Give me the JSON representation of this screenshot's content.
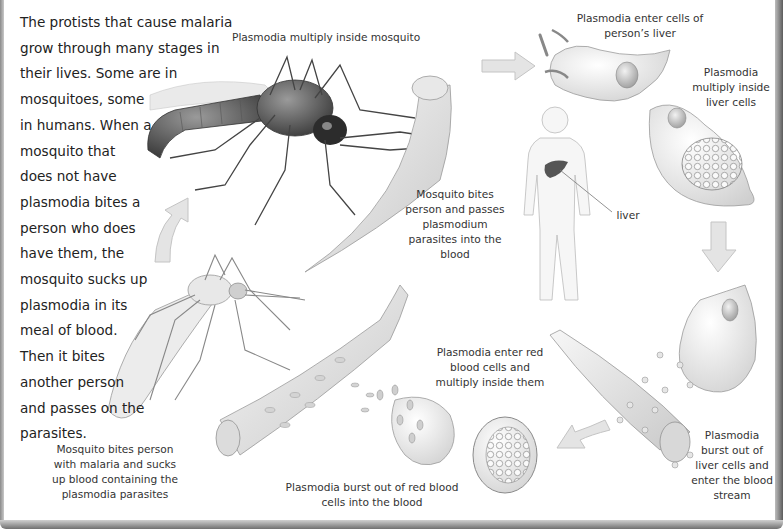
{
  "intro_text": {
    "lines": [
      "The protists that cause malaria",
      "grow through many stages in",
      "their lives. Some are in",
      "mosquitoes, some",
      "in humans. When a",
      "mosquito that",
      "does not have",
      "plasmodia bites a",
      "person who does",
      "have them, the",
      "mosquito sucks up",
      "plasmodia in its",
      "meal of blood.",
      "Then it bites",
      "another person",
      "and passes on the",
      "parasites."
    ]
  },
  "captions": {
    "multiply_mosquito": {
      "lines": [
        "Plasmodia multiply inside mosquito"
      ]
    },
    "enter_liver": {
      "lines": [
        "Plasmodia enter cells of",
        "person’s liver"
      ]
    },
    "multiply_liver": {
      "lines": [
        "Plasmodia",
        "multiply inside",
        "liver cells"
      ]
    },
    "bite_passes": {
      "lines": [
        "Mosquito bites",
        "person and passes",
        "plasmodium",
        "parasites into the",
        "blood"
      ]
    },
    "liver_label": {
      "lines": [
        "liver"
      ]
    },
    "enter_red_cells": {
      "lines": [
        "Plasmodia enter red",
        "blood cells and",
        "multiply inside them"
      ]
    },
    "burst_liver": {
      "lines": [
        "Plasmodia",
        "burst out of",
        "liver cells and",
        "enter the blood",
        "stream"
      ]
    },
    "burst_red_cells": {
      "lines": [
        "Plasmodia burst out of red blood",
        "cells into the blood"
      ]
    },
    "bite_sucks": {
      "lines": [
        "Mosquito bites person",
        "with malaria and sucks",
        "up blood containing the",
        "plasmodia parasites"
      ]
    }
  },
  "colors": {
    "arrow_fill": "#e4e4e4",
    "arrow_stroke": "#c4c4c4",
    "cell_fill": "#efefef",
    "cell_stroke": "#9a9a9a",
    "liver_organ": "#555555",
    "text": "#333333"
  }
}
